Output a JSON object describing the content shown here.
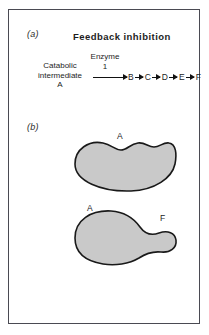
{
  "figure": {
    "panels": [
      {
        "label": "(a)",
        "title": "Feedback inhibition",
        "substrate": {
          "line1": "Catabolic",
          "line2": "intermediate",
          "line3": "A"
        },
        "enzyme": {
          "line1": "Enzyme",
          "line2": "1"
        },
        "chain": [
          "B",
          "C",
          "D",
          "E",
          "F"
        ]
      },
      {
        "label": "(b)",
        "shapes": [
          {
            "name": "enzyme-unbound",
            "site_labels": [
              "A"
            ]
          },
          {
            "name": "enzyme-bound",
            "site_labels": [
              "A",
              "F"
            ]
          }
        ]
      }
    ],
    "colors": {
      "blob_fill": "#c9c9c9",
      "blob_stroke": "#191919",
      "frame_border": "#4a4a52",
      "text": "#1d1d1d",
      "background": "#ffffff"
    }
  }
}
